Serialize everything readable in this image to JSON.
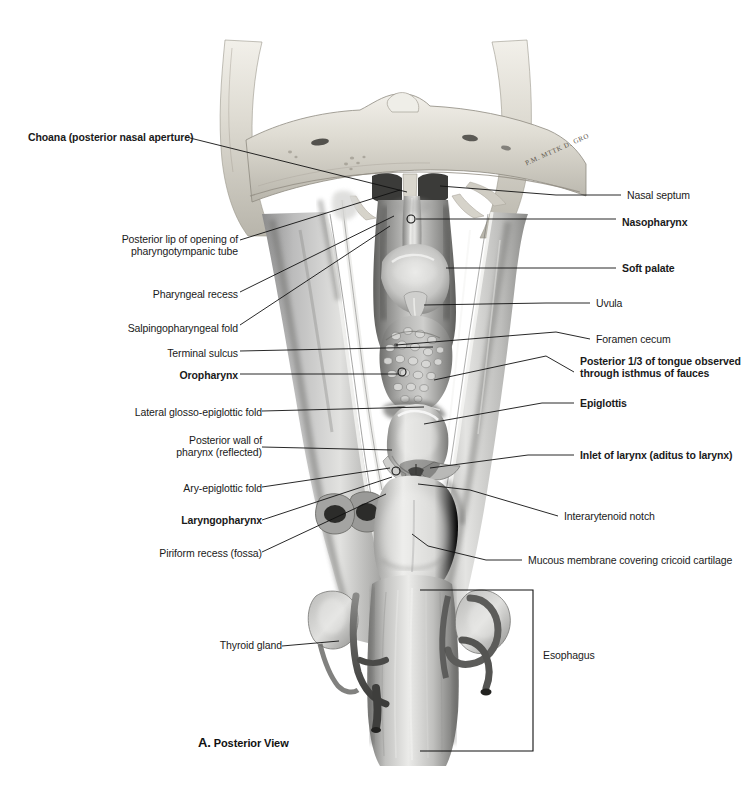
{
  "plate": {
    "caption_letter": "A.",
    "caption_text": " Posterior View",
    "view": "Posterior View",
    "signature": "P.M. MTTK D. GRO",
    "width": 748,
    "height": 792,
    "background": "#ffffff",
    "ink": "#1a1a1a"
  },
  "labels_left": [
    {
      "id": "choana",
      "text": "Choana (posterior nasal aperture)",
      "bold": true,
      "x": 188,
      "y": 131,
      "anchor_x": 407,
      "anchor_y": 192,
      "marker": "none"
    },
    {
      "id": "pharyngotympanic",
      "text": "Posterior lip of opening of\npharyngotympanic tube",
      "bold": false,
      "x": 237,
      "y": 233,
      "anchor_x": 396,
      "anchor_y": 190,
      "marker": "none"
    },
    {
      "id": "pharyngeal-recess",
      "text": "Pharyngeal recess",
      "bold": false,
      "x": 237,
      "y": 288,
      "anchor_x": 393,
      "anchor_y": 215,
      "marker": "none"
    },
    {
      "id": "salpingopharyngeal-fold",
      "text": "Salpingopharyngeal fold",
      "bold": false,
      "x": 237,
      "y": 322,
      "anchor_x": 391,
      "anchor_y": 225,
      "marker": "none"
    },
    {
      "id": "terminal-sulcus",
      "text": "Terminal sulcus",
      "bold": false,
      "x": 237,
      "y": 347,
      "anchor_x": 430,
      "anchor_y": 347,
      "marker": "none"
    },
    {
      "id": "oropharynx",
      "text": "Oropharynx",
      "bold": true,
      "x": 237,
      "y": 370,
      "anchor_x": 402,
      "anchor_y": 370,
      "marker": "circle"
    },
    {
      "id": "lateral-glosso-epiglottic-fold",
      "text": "Lateral glosso-epiglottic fold",
      "bold": false,
      "x": 258,
      "y": 407,
      "anchor_x": 422,
      "anchor_y": 407,
      "marker": "none"
    },
    {
      "id": "posterior-wall-pharynx",
      "text": "Posterior wall of\npharynx (reflected)",
      "bold": false,
      "x": 258,
      "y": 435,
      "anchor_x": 390,
      "anchor_y": 450,
      "marker": "none"
    },
    {
      "id": "ary-epiglottic-fold",
      "text": "Ary-epiglottic fold",
      "bold": false,
      "x": 258,
      "y": 483,
      "anchor_x": 391,
      "anchor_y": 467,
      "marker": "none"
    },
    {
      "id": "laryngopharynx",
      "text": "Laryngopharynx",
      "bold": true,
      "x": 258,
      "y": 519,
      "anchor_x": 392,
      "anchor_y": 475,
      "marker": "circle"
    },
    {
      "id": "piriform-recess",
      "text": "Piriform recess (fossa)",
      "bold": false,
      "x": 258,
      "y": 549,
      "anchor_x": 384,
      "anchor_y": 494,
      "marker": "none"
    },
    {
      "id": "thyroid-gland",
      "text": "Thyroid gland",
      "bold": false,
      "x": 275,
      "y": 642,
      "anchor_x": 337,
      "anchor_y": 642,
      "marker": "none"
    }
  ],
  "labels_right": [
    {
      "id": "nasal-septum",
      "text": "Nasal septum",
      "bold": false,
      "x": 625,
      "y": 195,
      "anchor_x": 556,
      "anchor_y": 195,
      "marker": "none"
    },
    {
      "id": "nasopharynx",
      "text": "Nasopharynx",
      "bold": true,
      "x": 620,
      "y": 223,
      "anchor_x": 410,
      "anchor_y": 219,
      "marker": "circle"
    },
    {
      "id": "soft-palate",
      "text": "Soft palate",
      "bold": true,
      "x": 620,
      "y": 268,
      "anchor_x": 516,
      "anchor_y": 268,
      "marker": "none"
    },
    {
      "id": "uvula",
      "text": "Uvula",
      "bold": false,
      "x": 594,
      "y": 303,
      "anchor_x": 418,
      "anchor_y": 305,
      "marker": "none"
    },
    {
      "id": "foramen-cecum",
      "text": "Foramen cecum",
      "bold": false,
      "x": 594,
      "y": 339,
      "anchor_x": 394,
      "anchor_y": 345,
      "marker": "none"
    },
    {
      "id": "posterior-third-tongue",
      "text": "Posterior 1/3 of tongue observed\nthrough isthmus of fauces",
      "bold": true,
      "x": 578,
      "y": 360,
      "anchor_x": 420,
      "anchor_y": 382,
      "marker": "none"
    },
    {
      "id": "epiglottis",
      "text": "Epiglottis",
      "bold": true,
      "x": 578,
      "y": 403,
      "anchor_x": 415,
      "anchor_y": 418,
      "marker": "none"
    },
    {
      "id": "inlet-of-larynx",
      "text": "Inlet of larynx (aditus to larynx)",
      "bold": true,
      "x": 578,
      "y": 455,
      "anchor_x": 420,
      "anchor_y": 452,
      "marker": "none"
    },
    {
      "id": "interarytenoid-notch",
      "text": "Interarytenoid notch",
      "bold": false,
      "x": 562,
      "y": 516,
      "anchor_x": 412,
      "anchor_y": 482,
      "marker": "none"
    },
    {
      "id": "mucous-membrane-cricoid",
      "text": "Mucous membrane covering cricoid cartilage",
      "bold": false,
      "x": 526,
      "y": 560,
      "anchor_x": 430,
      "anchor_y": 545,
      "marker": "none"
    },
    {
      "id": "esophagus",
      "text": "Esophagus",
      "bold": false,
      "x": 540,
      "y": 655,
      "anchor_x": 533,
      "anchor_y": 655,
      "marker": "bracket"
    }
  ],
  "bracket": {
    "id": "esophagus-bracket",
    "left": 420,
    "right": 533,
    "top": 590,
    "bottom": 751
  }
}
